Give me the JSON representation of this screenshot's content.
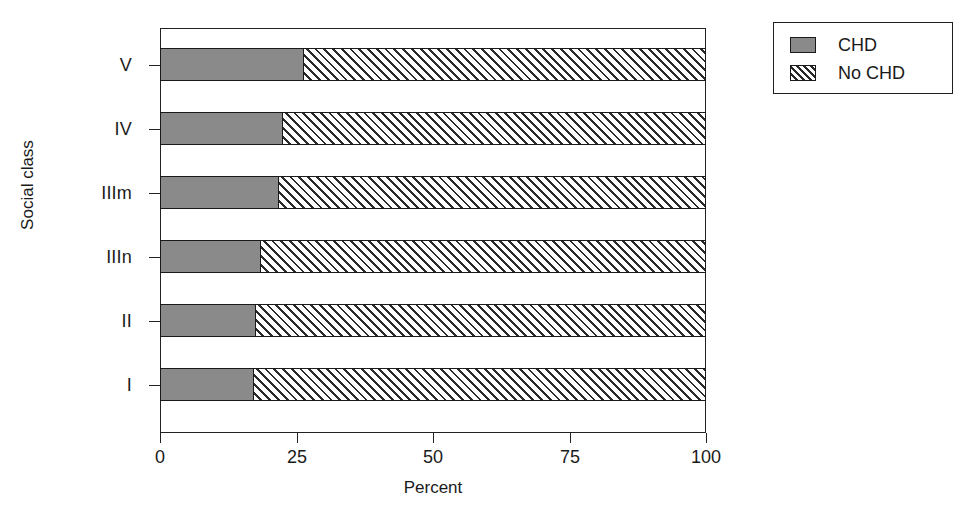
{
  "chart_data": {
    "type": "bar",
    "orientation": "horizontal",
    "stacked": true,
    "stack_mode": "percent",
    "title": "",
    "xlabel": "Percent",
    "ylabel": "Social class",
    "categories": [
      "I",
      "II",
      "IIIn",
      "IIIm",
      "IV",
      "V"
    ],
    "categories_top_to_bottom": [
      "V",
      "IV",
      "IIIm",
      "IIIn",
      "II",
      "I"
    ],
    "series": [
      {
        "name": "CHD",
        "fill": "solid-grey",
        "color": "#8a8a8a",
        "values": [
          17.2,
          17.6,
          18.5,
          21.8,
          22.5,
          26.4
        ]
      },
      {
        "name": "No CHD",
        "fill": "diagonal-hatch",
        "color": "#ffffff",
        "values": [
          82.8,
          82.4,
          81.5,
          78.2,
          77.5,
          73.6
        ]
      }
    ],
    "xlim": [
      0,
      100
    ],
    "xticks": [
      0,
      25,
      50,
      75,
      100
    ],
    "xtick_labels": [
      "0",
      "25",
      "50",
      "75",
      "100"
    ],
    "grid": false,
    "legend_position": "outside-top-right"
  },
  "axes": {
    "x": {
      "title": "Percent",
      "ticks": [
        {
          "value": 0,
          "label": "0"
        },
        {
          "value": 25,
          "label": "25"
        },
        {
          "value": 50,
          "label": "50"
        },
        {
          "value": 75,
          "label": "75"
        },
        {
          "value": 100,
          "label": "100"
        }
      ]
    },
    "y": {
      "title": "Social class",
      "ticks": [
        {
          "label": "V"
        },
        {
          "label": "IV"
        },
        {
          "label": "IIIm"
        },
        {
          "label": "IIIn"
        },
        {
          "label": "II"
        },
        {
          "label": "I"
        }
      ]
    }
  },
  "bars": [
    {
      "category": "V",
      "chd": 26.4,
      "nochd": 73.6
    },
    {
      "category": "IV",
      "chd": 22.5,
      "nochd": 77.5
    },
    {
      "category": "IIIm",
      "chd": 21.8,
      "nochd": 78.2
    },
    {
      "category": "IIIn",
      "chd": 18.5,
      "nochd": 81.5
    },
    {
      "category": "II",
      "chd": 17.6,
      "nochd": 82.4
    },
    {
      "category": "I",
      "chd": 17.2,
      "nochd": 82.8
    }
  ],
  "legend": {
    "entries": [
      {
        "label": "CHD",
        "swatch": "solid-grey-swatch"
      },
      {
        "label": "No CHD",
        "swatch": "hatched-swatch"
      }
    ]
  },
  "colors": {
    "chd_fill": "#8a8a8a",
    "nochd_fill": "#ffffff",
    "hatch_line": "#2a2a2a",
    "axis": "#222222",
    "text": "#1a1a1a",
    "background": "#ffffff"
  }
}
